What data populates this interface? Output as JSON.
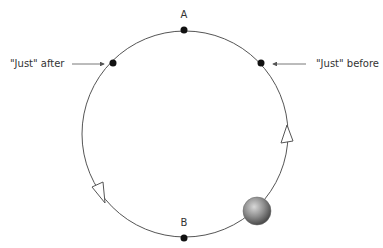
{
  "diagram": {
    "type": "circular-motion",
    "labels": {
      "top_point": "A",
      "bottom_point": "B",
      "just_after": "\"Just\" after",
      "just_before": "\"Just\" before"
    },
    "circle": {
      "cx": 185,
      "cy": 134,
      "r": 103,
      "stroke": "#555555"
    },
    "points": [
      {
        "name": "A",
        "x": 184,
        "y": 30
      },
      {
        "name": "B",
        "x": 184,
        "y": 238
      },
      {
        "name": "just-after",
        "x": 113,
        "y": 63
      },
      {
        "name": "just-before",
        "x": 261,
        "y": 63
      }
    ],
    "ball": {
      "cx": 257,
      "cy": 211,
      "r": 14,
      "color": "#8a8a8a"
    },
    "direction_arrows": [
      {
        "position": "left",
        "points": "92,187 103,182 105,203"
      },
      {
        "position": "right",
        "points": "287,125 281,143 293,141"
      }
    ],
    "colors": {
      "line": "#555555",
      "dot": "#111111",
      "text": "#333333"
    }
  }
}
